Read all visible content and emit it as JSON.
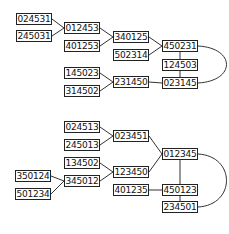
{
  "diagrams": [
    {
      "name": "top-graph",
      "nodes": [
        {
          "id": "024531",
          "x": 16,
          "y": 13
        },
        {
          "id": "245031",
          "x": 16,
          "y": 30
        },
        {
          "id": "012453",
          "x": 64,
          "y": 22
        },
        {
          "id": "401253",
          "x": 64,
          "y": 40
        },
        {
          "id": "340125",
          "x": 113,
          "y": 31
        },
        {
          "id": "502314",
          "x": 113,
          "y": 49
        },
        {
          "id": "450231",
          "x": 162,
          "y": 40
        },
        {
          "id": "124503",
          "x": 162,
          "y": 59
        },
        {
          "id": "023145",
          "x": 162,
          "y": 77
        },
        {
          "id": "145023",
          "x": 64,
          "y": 67
        },
        {
          "id": "314502",
          "x": 64,
          "y": 85
        },
        {
          "id": "231450",
          "x": 113,
          "y": 76
        }
      ],
      "edges": [
        [
          "024531",
          "012453"
        ],
        [
          "245031",
          "012453"
        ],
        [
          "012453",
          "340125"
        ],
        [
          "401253",
          "340125"
        ],
        [
          "340125",
          "450231"
        ],
        [
          "502314",
          "450231"
        ],
        [
          "450231",
          "124503"
        ],
        [
          "124503",
          "023145"
        ],
        [
          "450231",
          "023145",
          "curve"
        ],
        [
          "145023",
          "231450"
        ],
        [
          "314502",
          "231450"
        ],
        [
          "231450",
          "023145"
        ]
      ]
    },
    {
      "name": "bottom-graph",
      "nodes": [
        {
          "id": "024513",
          "x": 64,
          "y": 121
        },
        {
          "id": "245013",
          "x": 64,
          "y": 139
        },
        {
          "id": "023451",
          "x": 113,
          "y": 130
        },
        {
          "id": "134502",
          "x": 64,
          "y": 157
        },
        {
          "id": "350124",
          "x": 15,
          "y": 170
        },
        {
          "id": "501234",
          "x": 15,
          "y": 188
        },
        {
          "id": "345012",
          "x": 64,
          "y": 175
        },
        {
          "id": "123450",
          "x": 113,
          "y": 166
        },
        {
          "id": "012345",
          "x": 162,
          "y": 148
        },
        {
          "id": "401235",
          "x": 113,
          "y": 184
        },
        {
          "id": "450123",
          "x": 162,
          "y": 184
        },
        {
          "id": "234501",
          "x": 162,
          "y": 201
        }
      ],
      "edges": [
        [
          "024513",
          "023451"
        ],
        [
          "245013",
          "023451"
        ],
        [
          "023451",
          "012345"
        ],
        [
          "134502",
          "123450"
        ],
        [
          "345012",
          "123450"
        ],
        [
          "350124",
          "345012"
        ],
        [
          "501234",
          "345012"
        ],
        [
          "123450",
          "012345"
        ],
        [
          "012345",
          "450123"
        ],
        [
          "401235",
          "450123"
        ],
        [
          "450123",
          "234501"
        ],
        [
          "012345",
          "234501",
          "curve"
        ]
      ]
    }
  ]
}
